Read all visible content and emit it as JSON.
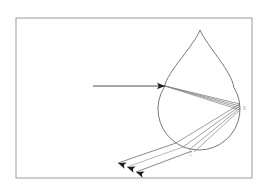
{
  "figure": {
    "background_color": "#ffffff",
    "frame": {
      "name": "figure-border",
      "x": 16,
      "y": 18,
      "width": 236,
      "height": 160,
      "stroke_color": "#9a9a9a"
    }
  },
  "droplet": {
    "label": "raindrop",
    "outline_color": "#555555",
    "center_x": 199,
    "center_y": 109,
    "radius": 41,
    "apex_x": 200,
    "apex_y": 30
  },
  "points": [
    {
      "id": "A",
      "label": "A",
      "x": 165,
      "y": 86,
      "description": "entry-point-refraction"
    },
    {
      "id": "B",
      "label": "B",
      "x": 240,
      "y": 107,
      "description": "internal-reflection-point"
    },
    {
      "id": "C",
      "label": "C",
      "x": 190,
      "y": 150,
      "description": "exit-point-refraction"
    }
  ],
  "incident_ray": {
    "name": "incident-sunlight-ray",
    "label": "incident ray",
    "x1": 93,
    "y1": 86,
    "x2": 165,
    "y2": 86,
    "color": "#3a3a3a"
  },
  "rays": {
    "color_default": "#6d6d6d",
    "internal_first": [
      {
        "name": "ray-A-to-B-1",
        "x1": 165,
        "y1": 86,
        "x2": 240,
        "y2": 104,
        "color": "#707070"
      },
      {
        "name": "ray-A-to-B-2",
        "x1": 165,
        "y1": 86,
        "x2": 240,
        "y2": 106,
        "color": "#777777"
      },
      {
        "name": "ray-A-to-B-3",
        "x1": 165,
        "y1": 86,
        "x2": 240,
        "y2": 108,
        "color": "#7e7e7e"
      },
      {
        "name": "ray-A-to-B-4",
        "x1": 165,
        "y1": 86,
        "x2": 240,
        "y2": 110,
        "color": "#858585"
      }
    ],
    "internal_second": [
      {
        "name": "ray-B-to-C-1",
        "x1": 240,
        "y1": 104,
        "x2": 176,
        "y2": 143,
        "color": "#707070"
      },
      {
        "name": "ray-B-to-C-2",
        "x1": 240,
        "y1": 106,
        "x2": 183,
        "y2": 147,
        "color": "#777777"
      },
      {
        "name": "ray-B-to-C-3",
        "x1": 240,
        "y1": 108,
        "x2": 189,
        "y2": 150,
        "color": "#7e7e7e"
      },
      {
        "name": "ray-B-to-C-4",
        "x1": 240,
        "y1": 110,
        "x2": 194,
        "y2": 152,
        "color": "#858585"
      }
    ],
    "exit_rays": [
      {
        "name": "exit-ray-1",
        "x1": 176,
        "y1": 143,
        "x2": 118,
        "y2": 163,
        "color": "#555555"
      },
      {
        "name": "exit-ray-2",
        "x1": 183,
        "y1": 147,
        "x2": 127,
        "y2": 167,
        "color": "#9a9a9a"
      },
      {
        "name": "exit-ray-3",
        "x1": 192,
        "y1": 151,
        "x2": 136,
        "y2": 172,
        "color": "#555555"
      }
    ]
  },
  "arrows": [
    {
      "name": "incident-arrowhead",
      "x": 165,
      "y": 86,
      "angle": 0
    },
    {
      "name": "exit-arrowhead-1",
      "x": 118,
      "y": 163,
      "angle": 199
    },
    {
      "name": "exit-arrowhead-2",
      "x": 127,
      "y": 167,
      "angle": 199
    },
    {
      "name": "exit-arrowhead-3",
      "x": 136,
      "y": 172,
      "angle": 199
    }
  ]
}
